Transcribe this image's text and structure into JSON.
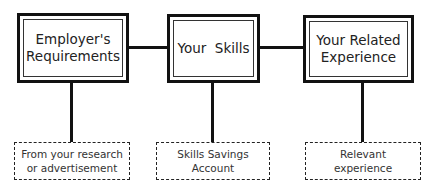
{
  "diagram": {
    "top_boxes": [
      {
        "id": "employers-requirements",
        "label": "Employer's\nRequirements"
      },
      {
        "id": "your-skills",
        "label": "Your  Skills"
      },
      {
        "id": "your-related-experience",
        "label": "Your Related\nExperience"
      }
    ],
    "bottom_boxes": [
      {
        "id": "research-source",
        "label": "From your research\nor advertisement"
      },
      {
        "id": "skills-savings",
        "label": "Skills Savings\nAccount"
      },
      {
        "id": "relevant-experience",
        "label": "Relevant\nexperience"
      }
    ],
    "connections": [
      {
        "from": "employers-requirements",
        "to": "your-skills",
        "style": "solid"
      },
      {
        "from": "your-skills",
        "to": "your-related-experience",
        "style": "solid"
      },
      {
        "from": "employers-requirements",
        "to": "research-source",
        "style": "solid"
      },
      {
        "from": "your-skills",
        "to": "skills-savings",
        "style": "solid"
      },
      {
        "from": "your-related-experience",
        "to": "relevant-experience",
        "style": "solid"
      }
    ]
  }
}
